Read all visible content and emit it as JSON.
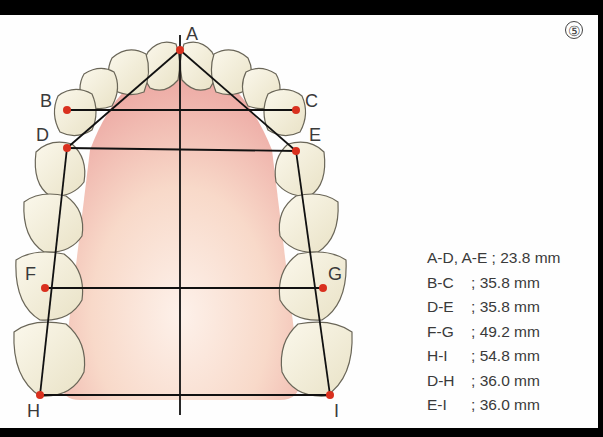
{
  "figure": {
    "number": "⑤",
    "type": "maxillary dental arch measurement diagram"
  },
  "points": [
    {
      "id": "A",
      "x": 180,
      "y": 50,
      "label_x": 186,
      "label_y": 40
    },
    {
      "id": "B",
      "x": 67,
      "y": 110,
      "label_x": 40,
      "label_y": 107
    },
    {
      "id": "C",
      "x": 296,
      "y": 110,
      "label_x": 305,
      "label_y": 107
    },
    {
      "id": "D",
      "x": 67,
      "y": 148,
      "label_x": 36,
      "label_y": 141
    },
    {
      "id": "E",
      "x": 296,
      "y": 151,
      "label_x": 309,
      "label_y": 141
    },
    {
      "id": "F",
      "x": 45,
      "y": 288,
      "label_x": 25,
      "label_y": 280
    },
    {
      "id": "G",
      "x": 323,
      "y": 288,
      "label_x": 328,
      "label_y": 280
    },
    {
      "id": "H",
      "x": 40,
      "y": 395,
      "label_x": 27,
      "label_y": 417
    },
    {
      "id": "I",
      "x": 330,
      "y": 395,
      "label_x": 334,
      "label_y": 417
    }
  ],
  "measurements": [
    {
      "key": "A-D, A-E",
      "sep": " ; ",
      "value": "23.8 mm",
      "indent": false
    },
    {
      "key": "B-C",
      "sep": "; ",
      "value": "35.8 mm",
      "indent": true
    },
    {
      "key": "D-E",
      "sep": "; ",
      "value": "35.8 mm",
      "indent": true
    },
    {
      "key": "F-G",
      "sep": "; ",
      "value": "49.2 mm",
      "indent": true
    },
    {
      "key": "H-I",
      "sep": "; ",
      "value": "54.8 mm",
      "indent": true
    },
    {
      "key": "D-H",
      "sep": "; ",
      "value": "36.0 mm",
      "indent": true
    },
    {
      "key": "E-I",
      "sep": "; ",
      "value": "36.0 mm",
      "indent": true
    }
  ],
  "colors": {
    "frame": "#000000",
    "background": "#fefefe",
    "palate_light": "#fbe6da",
    "palate_dark": "#eaa6a0",
    "tooth_fill": "#f3eedb",
    "tooth_outline": "#6a6658",
    "line": "#111111",
    "point": "#d9301e",
    "text": "#3a3a3a"
  }
}
